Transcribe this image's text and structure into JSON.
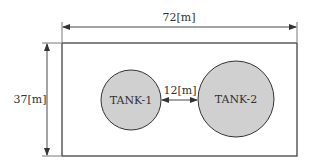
{
  "diagram": {
    "site": {
      "width_label": "72[m]",
      "height_label": "37[m]"
    },
    "tanks": [
      {
        "label": "TANK-1",
        "fill": "#d0d0d0"
      },
      {
        "label": "TANK-2",
        "fill": "#d0d0d0"
      }
    ],
    "spacing_label": "12[m]",
    "colors": {
      "line": "#333333",
      "tank_fill": "#d0d0d0",
      "background": "#ffffff"
    }
  }
}
